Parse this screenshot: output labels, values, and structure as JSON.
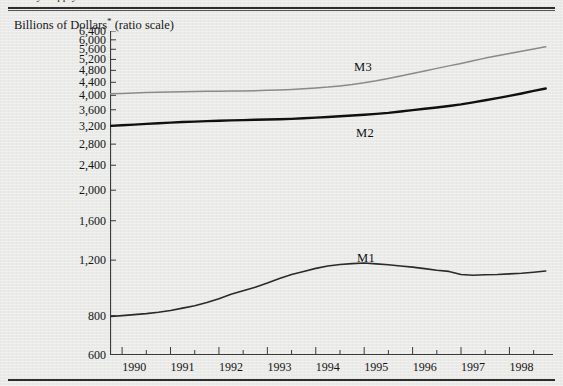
{
  "page": {
    "running_head": "Money Supply Growth in the United States",
    "background_color": "#eaeae8",
    "rule_color": "#2d2d2d"
  },
  "axis_caption": {
    "text": "Billions of Dollars",
    "footnote_marker": "*",
    "scale_note": " (ratio scale)"
  },
  "series_labels": {
    "m1": "M1",
    "m2": "M2",
    "m3": "M3"
  },
  "colors": {
    "m1_line": "#2a2a2a",
    "m2_line": "#101010",
    "m3_line": "#8a8a8a",
    "axis": "#3a3a3a",
    "text": "#141414"
  },
  "chart_data": {
    "type": "line",
    "title": "Money Supply Growth in the United States",
    "subtitle": "",
    "xlabel": "",
    "ylabel": "Billions of Dollars* (ratio scale)",
    "scale": "log",
    "grid": false,
    "legend": "inline-annotations",
    "ylim": [
      600,
      6400
    ],
    "xlim": [
      1989.75,
      1998.9
    ],
    "ytick_labels": [
      "6,400",
      "6,000",
      "5,600",
      "5,200",
      "4,800",
      "4,400",
      "4,000",
      "3,600",
      "3,200",
      "2,800",
      "2,400",
      "2,000",
      "1,600",
      "1,200",
      "800",
      "600"
    ],
    "yticks": [
      6400,
      6000,
      5600,
      5200,
      4800,
      4400,
      4000,
      3600,
      3200,
      2800,
      2400,
      2000,
      1600,
      1200,
      800,
      600
    ],
    "xtick_labels": [
      "1990",
      "1991",
      "1992",
      "1993",
      "1994",
      "1995",
      "1996",
      "1997",
      "1998"
    ],
    "xticks": [
      1990,
      1991,
      1992,
      1993,
      1994,
      1995,
      1996,
      1997,
      1998
    ],
    "xtick_minor_step": 0.5,
    "x": [
      1989.75,
      1990.0,
      1990.25,
      1990.5,
      1990.75,
      1991.0,
      1991.25,
      1991.5,
      1991.75,
      1992.0,
      1992.25,
      1992.5,
      1992.75,
      1993.0,
      1993.25,
      1993.5,
      1993.75,
      1994.0,
      1994.25,
      1994.5,
      1994.75,
      1995.0,
      1995.25,
      1995.5,
      1995.75,
      1996.0,
      1996.25,
      1996.5,
      1996.75,
      1997.0,
      1997.25,
      1997.5,
      1997.75,
      1998.0,
      1998.25,
      1998.5,
      1998.75
    ],
    "series": [
      {
        "name": "M1",
        "color": "#2a2a2a",
        "width": 1.6,
        "values": [
          795,
          800,
          806,
          812,
          820,
          830,
          845,
          860,
          880,
          905,
          935,
          960,
          985,
          1015,
          1050,
          1080,
          1105,
          1130,
          1150,
          1162,
          1170,
          1175,
          1168,
          1160,
          1150,
          1140,
          1128,
          1115,
          1105,
          1080,
          1075,
          1078,
          1080,
          1085,
          1090,
          1098,
          1108
        ]
      },
      {
        "name": "M2",
        "color": "#101010",
        "width": 2.4,
        "values": [
          3200,
          3215,
          3230,
          3248,
          3262,
          3278,
          3292,
          3300,
          3312,
          3322,
          3330,
          3338,
          3345,
          3352,
          3358,
          3368,
          3382,
          3398,
          3415,
          3432,
          3452,
          3470,
          3492,
          3520,
          3555,
          3590,
          3625,
          3660,
          3700,
          3745,
          3800,
          3858,
          3920,
          3985,
          4055,
          4130,
          4205
        ]
      },
      {
        "name": "M3",
        "color": "#8a8a8a",
        "width": 1.5,
        "values": [
          4045,
          4055,
          4068,
          4080,
          4090,
          4100,
          4108,
          4112,
          4118,
          4124,
          4128,
          4132,
          4138,
          4148,
          4160,
          4175,
          4195,
          4220,
          4248,
          4285,
          4330,
          4385,
          4450,
          4525,
          4605,
          4690,
          4780,
          4870,
          4960,
          5050,
          5150,
          5250,
          5340,
          5430,
          5520,
          5615,
          5700
        ]
      }
    ]
  }
}
